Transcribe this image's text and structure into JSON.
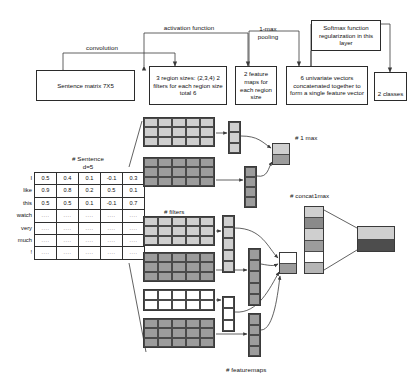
{
  "figure": {
    "title_absent": true
  },
  "arrow_labels": [
    {
      "name": "convolution",
      "text": "convolution",
      "x": 74,
      "y": 44,
      "w": 56
    },
    {
      "name": "activation-function",
      "text": "activation function",
      "x": 152,
      "y": 24,
      "w": 74
    },
    {
      "name": "1-max-pooling",
      "text": "1-max\npooling",
      "x": 248,
      "y": 25,
      "w": 40
    }
  ],
  "boxes": [
    {
      "name": "sentence-matrix-box",
      "text": "Sentence matrix\n7X5",
      "x": 36,
      "y": 70,
      "w": 99,
      "h": 31
    },
    {
      "name": "region-sizes-box",
      "text": "3 region sizes:\n(2,3,4)          2\nfilters for each\nregion size  total 6",
      "x": 149,
      "y": 66,
      "w": 78,
      "h": 39
    },
    {
      "name": "feature-maps-box",
      "text": "2 feature\nmaps for\neach region\nsize",
      "x": 235,
      "y": 66,
      "w": 42,
      "h": 39
    },
    {
      "name": "univariate-vectors-box",
      "text": "6 univariate vectors\nconcatenated together\nto form a single\nfeature vector",
      "x": 286,
      "y": 66,
      "w": 82,
      "h": 39
    },
    {
      "name": "softmax-box",
      "text": "Softmax function\nregularization in\nthis layer",
      "x": 311,
      "y": 20,
      "w": 70,
      "h": 31
    },
    {
      "name": "classes-box",
      "text": "2 classes",
      "x": 374,
      "y": 72,
      "w": 33,
      "h": 29
    }
  ],
  "matrix": {
    "caption": "# Sentence\nd=5",
    "caption_x": 38,
    "caption_y": 155,
    "row_labels": [
      "I",
      "like",
      "this",
      "watch",
      "very",
      "much",
      "!"
    ],
    "rows": [
      [
        "0.5",
        "0.4",
        "0.1",
        "-0.1",
        "0.3"
      ],
      [
        "0.9",
        "0.8",
        "0.2",
        "0.5",
        "0.1"
      ],
      [
        "0.5",
        "0.5",
        "0.1",
        "-0.1",
        "0.7"
      ],
      [
        "....",
        "....",
        "....",
        "....",
        "...."
      ],
      [
        "....",
        "....",
        "....",
        "....",
        "...."
      ],
      [
        "....",
        "....",
        "....",
        "....",
        "...."
      ],
      [
        "....",
        "....",
        "....",
        "....",
        "...."
      ]
    ]
  },
  "inline_labels": [
    {
      "name": "filters-label",
      "text": "# filters",
      "x": 164,
      "y": 208
    },
    {
      "name": "featuremaps-label",
      "text": "# featuremaps",
      "x": 226,
      "y": 366
    },
    {
      "name": "one-max-label",
      "text": "# 1 max",
      "x": 295,
      "y": 134
    },
    {
      "name": "concat1max-label",
      "text": "# concat1max",
      "x": 290,
      "y": 192
    }
  ],
  "feature_map_blocks": [
    {
      "name": "featuremap-grid-1",
      "x": 143,
      "y": 117,
      "w": 72,
      "h": 30,
      "cols": 5,
      "rows": 3,
      "fill": "#cfcfcf"
    },
    {
      "name": "featuremap-grid-2",
      "x": 143,
      "y": 157,
      "w": 72,
      "h": 30,
      "cols": 5,
      "rows": 3,
      "fill": "#9c9c9c"
    },
    {
      "name": "featuremap-grid-3",
      "x": 143,
      "y": 216,
      "w": 72,
      "h": 30,
      "cols": 5,
      "rows": 3,
      "fill": "#cfcfcf"
    },
    {
      "name": "featuremap-grid-4",
      "x": 143,
      "y": 252,
      "w": 72,
      "h": 30,
      "cols": 5,
      "rows": 3,
      "fill": "#9c9c9c"
    },
    {
      "name": "featuremap-grid-5",
      "x": 143,
      "y": 289,
      "w": 72,
      "h": 22,
      "cols": 5,
      "rows": 2,
      "fill": "#ffffff"
    },
    {
      "name": "featuremap-grid-6",
      "x": 143,
      "y": 318,
      "w": 72,
      "h": 30,
      "cols": 5,
      "rows": 3,
      "fill": "#9c9c9c"
    }
  ],
  "vector_columns": [
    {
      "name": "vector-col-1",
      "x": 228,
      "y": 121,
      "w": 13,
      "h": 33,
      "cells": 3,
      "fill": "#cfcfcf"
    },
    {
      "name": "vector-col-2",
      "x": 244,
      "y": 166,
      "w": 13,
      "h": 42,
      "cells": 4,
      "fill": "#9c9c9c"
    },
    {
      "name": "vector-col-3",
      "x": 222,
      "y": 215,
      "w": 13,
      "h": 58,
      "cells": 5,
      "fill": "#cfcfcf"
    },
    {
      "name": "vector-col-4",
      "x": 248,
      "y": 248,
      "w": 13,
      "h": 58,
      "cells": 5,
      "fill": "#9c9c9c"
    },
    {
      "name": "vector-col-5",
      "x": 222,
      "y": 296,
      "w": 13,
      "h": 36,
      "cells": 3,
      "fill": "#ffffff"
    },
    {
      "name": "vector-col-6",
      "x": 248,
      "y": 313,
      "w": 13,
      "h": 44,
      "cells": 4,
      "fill": "#9c9c9c"
    }
  ],
  "max_cells": [
    {
      "name": "max-cell-top",
      "x": 272,
      "y": 143,
      "w": 18,
      "h": 22,
      "parts": [
        "#cfcfcf",
        "#9c9c9c"
      ]
    },
    {
      "name": "max-cell-bottom",
      "x": 279,
      "y": 252,
      "w": 18,
      "h": 22,
      "parts": [
        "#ffffff",
        "#9c9c9c"
      ]
    }
  ],
  "concat_vector": {
    "name": "concat-vector",
    "x": 304,
    "y": 206,
    "w": 20,
    "h": 68,
    "cells": [
      "#cfcfcf",
      "#8a8a8a",
      "#cfcfcf",
      "#9c9c9c",
      "#ffffff",
      "#b5b5b5"
    ]
  },
  "output_block": {
    "name": "output-classes-block",
    "x": 357,
    "y": 226,
    "w": 38,
    "h": 26,
    "cells": [
      "#cfcfcf",
      "#4d4d4d"
    ]
  }
}
